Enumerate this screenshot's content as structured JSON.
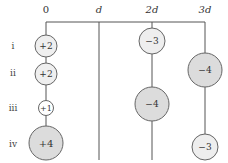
{
  "diagram": {
    "axis": {
      "labels": [
        "0",
        "d",
        "2d",
        "3d"
      ],
      "line_color": "#555555"
    },
    "rows": [
      {
        "label": "i"
      },
      {
        "label": "ii"
      },
      {
        "label": "iii"
      },
      {
        "label": "iv"
      }
    ],
    "charges": [
      {
        "row": "i",
        "column": "0",
        "value": "+2",
        "size": "medium",
        "fill": "#efefef"
      },
      {
        "row": "ii",
        "column": "0",
        "value": "+2",
        "size": "medium",
        "fill": "#efefef"
      },
      {
        "row": "iii",
        "column": "0",
        "value": "+1",
        "size": "small",
        "fill": "#ffffff"
      },
      {
        "row": "iv",
        "column": "0",
        "value": "+4",
        "size": "large",
        "fill": "#dcdcdc"
      },
      {
        "row": "i",
        "column": "2d",
        "value": "−3",
        "size": "medium-large",
        "fill": "#eeeeee"
      },
      {
        "row": "iii",
        "column": "2d",
        "value": "−4",
        "size": "large",
        "fill": "#dcdcdc"
      },
      {
        "row": "ii",
        "column": "3d",
        "value": "−4",
        "size": "large",
        "fill": "#dcdcdc"
      },
      {
        "row": "iv",
        "column": "3d",
        "value": "−3",
        "size": "medium-large",
        "fill": "#eeeeee"
      }
    ]
  }
}
